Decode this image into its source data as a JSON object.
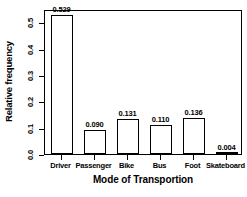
{
  "chart_data": {
    "type": "bar",
    "title": "",
    "xlabel": "Mode of Transportion",
    "ylabel": "Relative frequency",
    "categories": [
      "Driver",
      "Passenger",
      "Bike",
      "Bus",
      "Foot",
      "Skateboard"
    ],
    "values": [
      0.529,
      0.09,
      0.131,
      0.11,
      0.136,
      0.004
    ],
    "value_labels": [
      "0.529",
      "0.090",
      "0.131",
      "0.110",
      "0.136",
      "0.004"
    ],
    "ylim": [
      0.0,
      0.55
    ],
    "yticks": [
      0.0,
      0.1,
      0.2,
      0.3,
      0.4,
      0.5
    ],
    "ytick_labels": [
      "0.0",
      "0.1",
      "0.2",
      "0.3",
      "0.4",
      "0.5"
    ],
    "grid": false,
    "legend": null,
    "bar_fill_color": "#ffffff",
    "bar_edge_color": "#000000",
    "axis_color": "#000000",
    "background_color": "#ffffff"
  }
}
